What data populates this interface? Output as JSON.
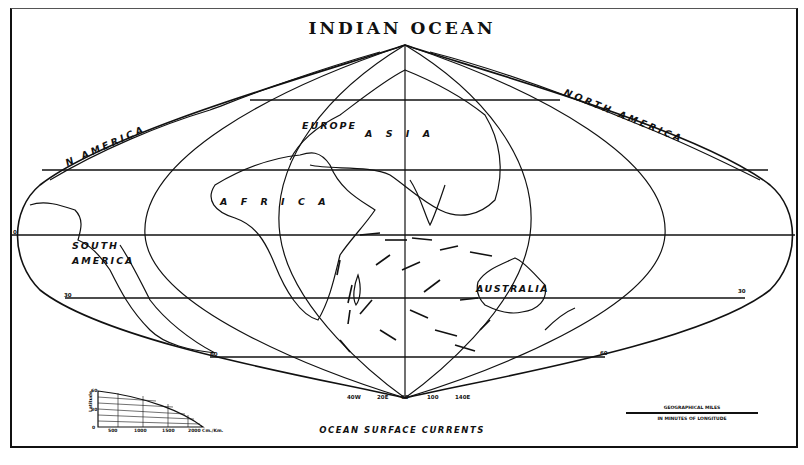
{
  "map": {
    "title": "INDIAN OCEAN",
    "subtitle": "OCEAN SURFACE CURRENTS",
    "projection": "sinusoidal",
    "region_labels": [
      {
        "id": "n-america-west",
        "text": "N AMERICA"
      },
      {
        "id": "north-america-east",
        "text": "NORTH AMERICA"
      },
      {
        "id": "europe",
        "text": "EUROPE"
      },
      {
        "id": "asia",
        "text": "A S I A"
      },
      {
        "id": "africa",
        "text": "A F R I C A"
      },
      {
        "id": "south-america",
        "text": "SOUTH AMERICA"
      },
      {
        "id": "australia",
        "text": "AUSTRALIA"
      }
    ],
    "latitude_labels": {
      "left_equator": "0",
      "left_30": "30",
      "left_60": "60",
      "right_30": "30",
      "right_60": "60"
    },
    "meridian_labels": [
      "40W",
      "20E",
      "60",
      "100",
      "140E"
    ],
    "legend_left": {
      "axis_label": "Latitude",
      "y_ticks": [
        "0",
        "30",
        "60"
      ],
      "x_ticks": [
        "500",
        "1000",
        "1500",
        "2000 Cm./Km."
      ]
    },
    "legend_right": {
      "title": "GEOGRAPHICAL MILES",
      "caption": "IN MINUTES OF LONGITUDE",
      "ticks": [
        "0",
        "100",
        "200",
        "300",
        "400",
        "500",
        "600"
      ]
    },
    "colors": {
      "ink": "#111111",
      "paper": "#ffffff"
    }
  }
}
